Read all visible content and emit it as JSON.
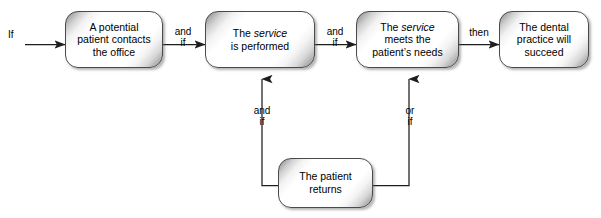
{
  "diagram": {
    "type": "flowchart",
    "colors": {
      "box_border": "#4a4a4a",
      "box_fill_light": "#ffffff",
      "box_fill_shadow": "#8d8d8d",
      "line": "#2b2b2b",
      "text": "#000000",
      "background": "#ffffff"
    },
    "nodes": [
      {
        "id": "node-potential-patient",
        "text": "A potential\npatient contacts\nthe office",
        "lines": [
          "A potential",
          "patient contacts",
          "the office"
        ]
      },
      {
        "id": "node-service-performed",
        "text": "The service\nis performed",
        "lines": [
          "The service",
          "is performed"
        ],
        "italic_word": "service"
      },
      {
        "id": "node-service-meets-needs",
        "text": "The service\nmeets the\npatient's needs",
        "lines": [
          "The service",
          "meets the",
          "patient's needs"
        ],
        "italic_word": "service"
      },
      {
        "id": "node-practice-succeed",
        "text": "The dental\npractice will\nsucceed",
        "lines": [
          "The dental",
          "practice will",
          "succeed"
        ]
      },
      {
        "id": "node-patient-returns",
        "text": "The patient\nreturns",
        "lines": [
          "The patient",
          "returns"
        ]
      }
    ],
    "edge_labels": {
      "start_if": "If",
      "and_if_1": "and\nif",
      "and_if_2": "and\nif",
      "then": "then",
      "and_if_up_left": "and\nif",
      "or_if_up_right": "or\nif"
    }
  }
}
